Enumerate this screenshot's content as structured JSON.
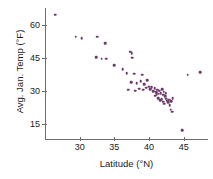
{
  "chart_data": {
    "type": "scatter",
    "title": "",
    "xlabel": "Latitude (°N)",
    "ylabel": "Avg. Jan. Temp (°F)",
    "xlim": [
      25,
      48.5
    ],
    "ylim": [
      8,
      68
    ],
    "xticks": [
      30,
      35,
      40,
      45
    ],
    "yticks": [
      15,
      30,
      45,
      60
    ],
    "xtick_labels": [
      "30",
      "35",
      "40",
      "45"
    ],
    "ytick_labels": [
      "15",
      "30",
      "45",
      "60"
    ],
    "grid": false,
    "legend": "none",
    "point_color": "#6b3a6b",
    "axis_color": "#6e6e6e",
    "points": [
      {
        "x": 26.5,
        "y": 65.0
      },
      {
        "x": 29.4,
        "y": 54.8
      },
      {
        "x": 30.3,
        "y": 54.2
      },
      {
        "x": 32.5,
        "y": 54.8
      },
      {
        "x": 33.7,
        "y": 52.0
      },
      {
        "x": 32.4,
        "y": 45.6
      },
      {
        "x": 33.2,
        "y": 44.8
      },
      {
        "x": 33.8,
        "y": 44.8
      },
      {
        "x": 37.3,
        "y": 48.0
      },
      {
        "x": 37.5,
        "y": 47.2
      },
      {
        "x": 37.6,
        "y": 45.2
      },
      {
        "x": 35.0,
        "y": 41.8
      },
      {
        "x": 36.2,
        "y": 40.0
      },
      {
        "x": 36.8,
        "y": 38.2
      },
      {
        "x": 37.9,
        "y": 38.0
      },
      {
        "x": 39.0,
        "y": 37.5
      },
      {
        "x": 37.4,
        "y": 34.0
      },
      {
        "x": 38.2,
        "y": 33.5
      },
      {
        "x": 38.8,
        "y": 34.5
      },
      {
        "x": 39.3,
        "y": 33.0
      },
      {
        "x": 39.7,
        "y": 34.8
      },
      {
        "x": 37.0,
        "y": 30.5
      },
      {
        "x": 38.0,
        "y": 30.2
      },
      {
        "x": 38.6,
        "y": 31.0
      },
      {
        "x": 39.2,
        "y": 30.5
      },
      {
        "x": 39.6,
        "y": 31.5
      },
      {
        "x": 40.0,
        "y": 32.0
      },
      {
        "x": 40.2,
        "y": 30.8
      },
      {
        "x": 40.4,
        "y": 31.8
      },
      {
        "x": 40.6,
        "y": 30.0
      },
      {
        "x": 40.8,
        "y": 31.2
      },
      {
        "x": 41.0,
        "y": 29.5
      },
      {
        "x": 41.2,
        "y": 30.6
      },
      {
        "x": 41.4,
        "y": 28.8
      },
      {
        "x": 41.5,
        "y": 30.2
      },
      {
        "x": 41.7,
        "y": 29.0
      },
      {
        "x": 41.9,
        "y": 30.8
      },
      {
        "x": 42.0,
        "y": 28.2
      },
      {
        "x": 42.1,
        "y": 29.6
      },
      {
        "x": 42.3,
        "y": 27.5
      },
      {
        "x": 42.4,
        "y": 29.0
      },
      {
        "x": 42.5,
        "y": 26.5
      },
      {
        "x": 41.3,
        "y": 26.8
      },
      {
        "x": 41.6,
        "y": 25.8
      },
      {
        "x": 41.8,
        "y": 26.2
      },
      {
        "x": 42.0,
        "y": 25.0
      },
      {
        "x": 42.2,
        "y": 24.2
      },
      {
        "x": 42.6,
        "y": 25.5
      },
      {
        "x": 42.8,
        "y": 24.8
      },
      {
        "x": 43.0,
        "y": 23.5
      },
      {
        "x": 42.9,
        "y": 26.0
      },
      {
        "x": 43.2,
        "y": 25.2
      },
      {
        "x": 43.4,
        "y": 26.8
      },
      {
        "x": 43.1,
        "y": 21.5
      },
      {
        "x": 43.3,
        "y": 20.5
      },
      {
        "x": 40.9,
        "y": 27.8
      },
      {
        "x": 41.1,
        "y": 28.5
      },
      {
        "x": 44.8,
        "y": 12.0
      },
      {
        "x": 45.6,
        "y": 37.5
      },
      {
        "x": 47.4,
        "y": 38.5
      }
    ]
  }
}
